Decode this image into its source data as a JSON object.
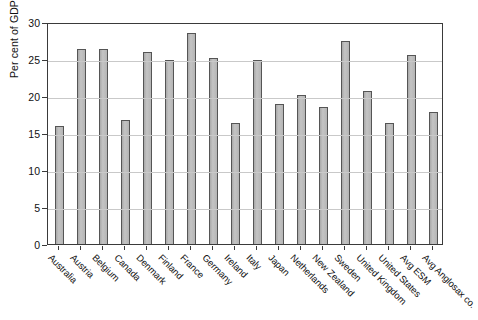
{
  "chart_data": {
    "type": "bar",
    "title": "",
    "xlabel": "",
    "ylabel": "Per cent of GDP",
    "ylim": [
      0,
      30
    ],
    "yticks": [
      0,
      5,
      10,
      15,
      20,
      25,
      30
    ],
    "ytick_labels": [
      "0",
      "5",
      "10",
      "15",
      "20",
      "25",
      "30"
    ],
    "grid": true,
    "legend": "none",
    "bar_color": "#b9b9b9",
    "bar_edge_color": "#555555",
    "categories": [
      "Australia",
      "Austria",
      "Belgium",
      "Canada",
      "Denmark",
      "Finland",
      "France",
      "Germany",
      "Ireland",
      "Italy",
      "Japan",
      "Netherlands",
      "New Zealand",
      "Sweden",
      "United Kingdom",
      "United States",
      "Avg ESM",
      "Avg Anglosax co."
    ],
    "values": [
      16.0,
      26.3,
      26.3,
      16.8,
      26.0,
      24.9,
      28.5,
      25.1,
      16.4,
      24.9,
      18.9,
      20.2,
      18.5,
      27.5,
      20.7,
      16.4,
      25.6,
      17.8
    ]
  }
}
